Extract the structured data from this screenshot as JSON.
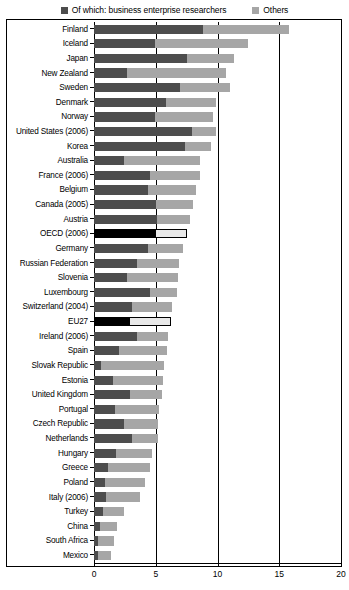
{
  "legend": {
    "items": [
      {
        "label": "Of which: business enterprise researchers",
        "icon": "square-dark-icon",
        "color": "#4d4d4d"
      },
      {
        "label": "Others",
        "icon": "square-light-icon",
        "color": "#a6a6a6"
      }
    ]
  },
  "axis": {
    "ticks": [
      "0",
      "5",
      "10",
      "15",
      "20"
    ],
    "tick_values": [
      0,
      5,
      10,
      15,
      20
    ]
  },
  "chart_data": {
    "type": "bar",
    "orientation": "horizontal",
    "stacked": true,
    "title": "",
    "subtitle": "",
    "xlabel": "",
    "ylabel": "",
    "xlim": [
      0,
      20
    ],
    "grid": true,
    "legend_position": "top",
    "categories": [
      "Finland",
      "Iceland",
      "Japan",
      "New Zealand",
      "Sweden",
      "Denmark",
      "Norway",
      "United States (2006)",
      "Korea",
      "Australia",
      "France (2006)",
      "Belgium",
      "Canada (2005)",
      "Austria",
      "OECD (2006)",
      "Germany",
      "Russian Federation",
      "Slovenia",
      "Luxembourg",
      "Switzerland (2004)",
      "EU27",
      "Ireland (2006)",
      "Spain",
      "Slovak Republic",
      "Estonia",
      "United Kingdom",
      "Portugal",
      "Czech Republic",
      "Netherlands",
      "Hungary",
      "Greece",
      "Poland",
      "Italy (2006)",
      "Turkey",
      "China",
      "South Africa",
      "Mexico"
    ],
    "series": [
      {
        "name": "Of which: business enterprise researchers",
        "color": "#4d4d4d",
        "values": [
          8.8,
          4.9,
          7.5,
          2.7,
          7.0,
          5.8,
          4.9,
          7.9,
          7.4,
          2.4,
          4.5,
          4.4,
          5.0,
          5.1,
          4.9,
          4.4,
          3.5,
          2.7,
          4.5,
          3.1,
          2.8,
          3.5,
          2.0,
          0.6,
          1.5,
          2.9,
          1.7,
          2.4,
          3.1,
          1.8,
          1.1,
          0.9,
          1.0,
          0.7,
          0.5,
          0.3,
          0.3
        ]
      },
      {
        "name": "Others",
        "color": "#a6a6a6",
        "values": [
          7.0,
          7.6,
          3.8,
          8.0,
          4.0,
          4.1,
          4.7,
          2.0,
          2.1,
          6.2,
          4.1,
          3.9,
          3.0,
          2.7,
          2.6,
          2.8,
          3.4,
          4.1,
          2.2,
          3.2,
          3.4,
          2.5,
          3.9,
          5.1,
          4.1,
          2.6,
          3.6,
          2.8,
          2.1,
          2.9,
          3.4,
          3.2,
          2.7,
          1.7,
          1.4,
          1.3,
          1.1
        ]
      }
    ],
    "totals": [
      15.8,
      12.5,
      11.3,
      10.7,
      11.0,
      9.9,
      9.6,
      9.9,
      9.5,
      8.6,
      8.6,
      8.3,
      8.0,
      7.8,
      7.5,
      7.2,
      6.9,
      6.8,
      6.7,
      6.3,
      6.2,
      6.0,
      5.9,
      5.7,
      5.6,
      5.5,
      5.3,
      5.2,
      5.2,
      4.7,
      4.5,
      4.1,
      3.7,
      2.4,
      1.9,
      1.6,
      1.4
    ],
    "highlighted": [
      "OECD (2006)",
      "EU27"
    ],
    "highlight_colors": {
      "dark": "#000000",
      "light": "#e8e8e8"
    }
  }
}
